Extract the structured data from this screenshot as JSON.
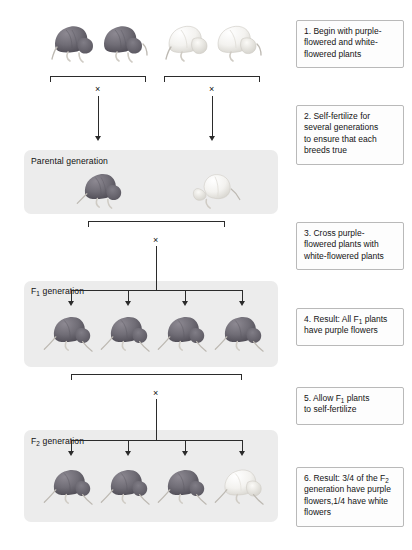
{
  "diagram": {
    "colors": {
      "band_background": "#ececec",
      "callout_background": "#fdfdfd",
      "callout_border": "#b9b9b9",
      "line": "#2b2b2b",
      "purple_flower": "#6e6b73",
      "white_flower": "#f2f1ef"
    }
  },
  "bands": [
    {
      "id": "parental",
      "label_prefix": "Parental generation",
      "label_sub": "",
      "label_suffix": ""
    },
    {
      "id": "f1",
      "label_prefix": "F",
      "label_sub": "1",
      "label_suffix": " generation"
    },
    {
      "id": "f2",
      "label_prefix": "F",
      "label_sub": "2",
      "label_suffix": " generation"
    }
  ],
  "callouts": [
    {
      "id": "step-1",
      "number": "1.",
      "line1": "1. Begin with purple-",
      "line2": "flowered and white-",
      "line3": "flowered plants",
      "text": "1. Begin with purple-flowered and white-flowered plants"
    },
    {
      "id": "step-2",
      "number": "2.",
      "line1": "2. Self-fertilize for",
      "line2": "several generations",
      "line3": "to ensure that each",
      "line4": "breeds true",
      "text": "2. Self-fertilize for several generations to ensure that each breeds true"
    },
    {
      "id": "step-3",
      "number": "3.",
      "line1": "3. Cross purple-",
      "line2": "flowered plants with",
      "line3": "white-flowered plants",
      "text": "3. Cross purple-flowered plants with white-flowered plants"
    },
    {
      "id": "step-4",
      "number": "4.",
      "prefix": "4. Result: All F",
      "sub": "1",
      "suffix": " plants",
      "line2": "have purple flowers",
      "text": "4. Result: All F1 plants have purple flowers"
    },
    {
      "id": "step-5",
      "number": "5.",
      "prefix": "5. Allow F",
      "sub": "1",
      "suffix": " plants",
      "line2": "to self-fertilize",
      "text": "5. Allow F1 plants to self-fertilize"
    },
    {
      "id": "step-6",
      "number": "6.",
      "prefix": "6. Result: 3/4 of the F",
      "sub": "2",
      "suffix": "",
      "line2": "generation have purple",
      "line3": "flowers,1/4 have white",
      "line4": "flowers",
      "text": "6. Result: 3/4 of the F2 generation have purple flowers,1/4 have white flowers"
    }
  ],
  "cross_symbols": [
    {
      "id": "cross-purple-parents",
      "symbol": "×"
    },
    {
      "id": "cross-white-parents",
      "symbol": "×"
    },
    {
      "id": "cross-parental",
      "symbol": "×"
    },
    {
      "id": "cross-f1-self",
      "symbol": "×"
    }
  ],
  "plants": {
    "top_row": [
      {
        "id": "top-purple-1",
        "phenotype": "purple"
      },
      {
        "id": "top-purple-2",
        "phenotype": "purple"
      },
      {
        "id": "top-white-1",
        "phenotype": "white"
      },
      {
        "id": "top-white-2",
        "phenotype": "white"
      }
    ],
    "parental": [
      {
        "id": "parental-purple",
        "phenotype": "purple"
      },
      {
        "id": "parental-white",
        "phenotype": "white"
      }
    ],
    "f1": [
      {
        "id": "f1-plant-1",
        "phenotype": "purple"
      },
      {
        "id": "f1-plant-2",
        "phenotype": "purple"
      },
      {
        "id": "f1-plant-3",
        "phenotype": "purple"
      },
      {
        "id": "f1-plant-4",
        "phenotype": "purple"
      }
    ],
    "f2": [
      {
        "id": "f2-plant-1",
        "phenotype": "purple"
      },
      {
        "id": "f2-plant-2",
        "phenotype": "purple"
      },
      {
        "id": "f2-plant-3",
        "phenotype": "purple"
      },
      {
        "id": "f2-plant-4",
        "phenotype": "white"
      }
    ]
  },
  "ratios": {
    "f1_purple": "All",
    "f2_purple": "3/4",
    "f2_white": "1/4"
  }
}
